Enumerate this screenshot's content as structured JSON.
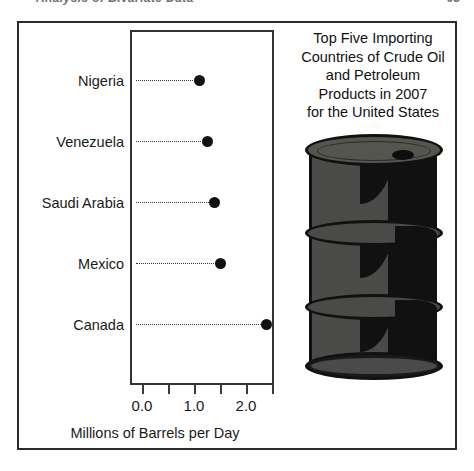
{
  "page_header": {
    "running_title": "Analysis of Bivariate Data",
    "page_number": "93"
  },
  "chart_title_lines": [
    "Top Five Importing",
    "Countries of Crude Oil",
    "and Petroleum",
    "Products in 2007",
    "for the United States"
  ],
  "axis": {
    "x_title": "Millions of Barrels per Day",
    "tick_labels": [
      "0.0",
      "1.0",
      "2.0"
    ],
    "tick_values": [
      0.0,
      1.0,
      2.0
    ],
    "minor_tick_values": [
      0.5,
      1.5,
      2.5
    ]
  },
  "illustration": {
    "name": "oil-barrel",
    "body_color": "#4a4a48",
    "outline_color": "#111111",
    "lid_color": "#55554f"
  },
  "colors": {
    "frame": "#2c2c2c",
    "panel_border": "#333333",
    "dot": "#111111",
    "text": "#1a1a1a",
    "leader": "#3a3a3a"
  },
  "chart_data": {
    "type": "scatter",
    "subtype": "dot-plot",
    "xlabel": "Millions of Barrels per Day",
    "ylabel": "",
    "orientation": "horizontal",
    "xlim": [
      0.0,
      2.6
    ],
    "xticks": [
      0.0,
      0.5,
      1.0,
      1.5,
      2.0,
      2.5
    ],
    "xticklabels": [
      "0.0",
      "",
      "1.0",
      "",
      "2.0",
      ""
    ],
    "grid": false,
    "legend": false,
    "leader_lines": "dotted",
    "categories": [
      "Nigeria",
      "Venezuela",
      "Saudi Arabia",
      "Mexico",
      "Canada"
    ],
    "values": [
      1.1,
      1.25,
      1.4,
      1.5,
      2.4
    ],
    "points": [
      {
        "category": "Nigeria",
        "value": 1.1
      },
      {
        "category": "Venezuela",
        "value": 1.25
      },
      {
        "category": "Saudi Arabia",
        "value": 1.4
      },
      {
        "category": "Mexico",
        "value": 1.5
      },
      {
        "category": "Canada",
        "value": 2.4
      }
    ]
  }
}
